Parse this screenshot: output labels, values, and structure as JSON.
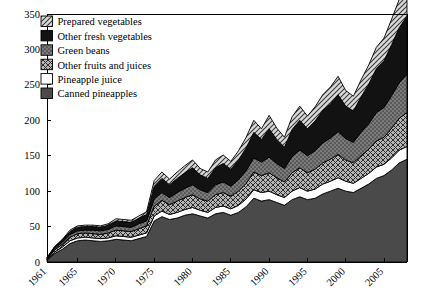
{
  "chart_data": {
    "type": "area",
    "title": "",
    "subtitle": "",
    "xlabel": "",
    "ylabel": "",
    "stacked": true,
    "grid": false,
    "legend_position": "top-left",
    "xlim": [
      1961,
      2008
    ],
    "ylim": [
      0,
      350
    ],
    "yticks": [
      0,
      50,
      100,
      150,
      200,
      250,
      300,
      350
    ],
    "xticks": [
      1961,
      1965,
      1970,
      1975,
      1980,
      1985,
      1990,
      1995,
      2000,
      2005
    ],
    "xtick_labels": [
      "1961",
      "1965",
      "1970",
      "1975",
      "1980",
      "1985",
      "1990",
      "1995",
      "2000",
      "2005"
    ],
    "ytick_labels": [
      "0",
      "50",
      "100",
      "150",
      "200",
      "250",
      "300",
      "350"
    ],
    "x": [
      1961,
      1962,
      1963,
      1964,
      1965,
      1966,
      1967,
      1968,
      1969,
      1970,
      1971,
      1972,
      1973,
      1974,
      1975,
      1976,
      1977,
      1978,
      1979,
      1980,
      1981,
      1982,
      1983,
      1984,
      1985,
      1986,
      1987,
      1988,
      1989,
      1990,
      1991,
      1992,
      1993,
      1994,
      1995,
      1996,
      1997,
      1998,
      1999,
      2000,
      2001,
      2002,
      2003,
      2004,
      2005,
      2006,
      2007,
      2008
    ],
    "series": [
      {
        "name": "Canned pineapples",
        "pattern": "solid-dark-gray",
        "color": "#494949",
        "values": [
          2,
          12,
          18,
          26,
          30,
          31,
          30,
          29,
          30,
          32,
          31,
          30,
          33,
          36,
          58,
          64,
          60,
          62,
          66,
          68,
          65,
          62,
          68,
          70,
          66,
          70,
          78,
          90,
          86,
          88,
          84,
          80,
          88,
          92,
          88,
          90,
          96,
          100,
          104,
          100,
          98,
          104,
          110,
          118,
          122,
          130,
          140,
          145
        ]
      },
      {
        "name": "Pineapple juice",
        "pattern": "solid-white",
        "color": "#ffffff",
        "values": [
          1,
          2,
          3,
          4,
          4,
          4,
          4,
          4,
          4,
          5,
          5,
          5,
          5,
          5,
          7,
          8,
          7,
          8,
          8,
          9,
          8,
          8,
          9,
          9,
          9,
          10,
          11,
          12,
          12,
          12,
          11,
          11,
          12,
          13,
          12,
          13,
          14,
          14,
          15,
          14,
          13,
          14,
          15,
          16,
          16,
          17,
          18,
          18
        ]
      },
      {
        "name": "Other fruits and juices",
        "pattern": "cross-hatch",
        "color": "#9a9a9a",
        "values": [
          1,
          3,
          4,
          5,
          6,
          6,
          6,
          6,
          7,
          8,
          8,
          8,
          9,
          10,
          14,
          15,
          14,
          16,
          17,
          18,
          16,
          16,
          18,
          19,
          18,
          20,
          22,
          25,
          24,
          26,
          24,
          22,
          26,
          28,
          26,
          28,
          30,
          31,
          33,
          30,
          29,
          32,
          34,
          37,
          38,
          42,
          45,
          48
        ]
      },
      {
        "name": "Green beans",
        "pattern": "dotted-gray",
        "color": "#7f7f7f",
        "values": [
          1,
          2,
          3,
          4,
          4,
          4,
          5,
          5,
          5,
          6,
          6,
          6,
          7,
          7,
          10,
          11,
          10,
          12,
          13,
          14,
          13,
          12,
          14,
          15,
          14,
          16,
          18,
          20,
          19,
          22,
          20,
          19,
          23,
          25,
          24,
          26,
          28,
          30,
          32,
          30,
          29,
          33,
          36,
          40,
          42,
          46,
          50,
          54
        ]
      },
      {
        "name": "Other fresh vegetables",
        "pattern": "solid-black",
        "color": "#111111",
        "values": [
          1,
          2,
          3,
          4,
          5,
          5,
          5,
          5,
          6,
          7,
          7,
          7,
          8,
          9,
          18,
          20,
          18,
          20,
          22,
          24,
          21,
          20,
          24,
          26,
          24,
          28,
          32,
          36,
          32,
          40,
          34,
          30,
          38,
          42,
          38,
          42,
          46,
          48,
          52,
          46,
          44,
          50,
          56,
          62,
          66,
          72,
          78,
          82
        ]
      },
      {
        "name": "Prepared vegetables",
        "pattern": "diagonal-hatch",
        "color": "#a8a8a8",
        "values": [
          0,
          1,
          1,
          2,
          2,
          2,
          2,
          2,
          2,
          3,
          3,
          3,
          3,
          4,
          8,
          9,
          8,
          9,
          10,
          11,
          9,
          9,
          11,
          12,
          11,
          13,
          15,
          17,
          15,
          19,
          16,
          14,
          18,
          20,
          18,
          20,
          22,
          24,
          26,
          22,
          21,
          24,
          27,
          30,
          32,
          36,
          40,
          42
        ]
      }
    ],
    "legend_entries": [
      {
        "label": "Prepared vegetables",
        "pattern": "diagonal-hatch"
      },
      {
        "label": "Other fresh vegetables",
        "pattern": "solid-black"
      },
      {
        "label": "Green beans",
        "pattern": "dotted-gray"
      },
      {
        "label": "Other fruits and juices",
        "pattern": "cross-hatch"
      },
      {
        "label": "Pineapple juice",
        "pattern": "solid-white"
      },
      {
        "label": "Canned pineapples",
        "pattern": "solid-dark-gray"
      }
    ]
  }
}
